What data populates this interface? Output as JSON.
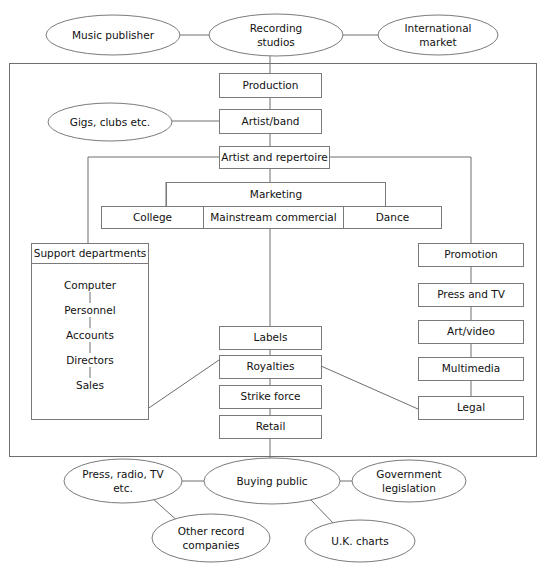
{
  "diagram": {
    "type": "org-flow-diagram",
    "style": {
      "background": "#ffffff",
      "stroke": "#6e6e6e",
      "node_fill": "#ffffff",
      "text_color": "#111111"
    },
    "external_top": [
      {
        "id": "music-publisher",
        "label": "Music publisher",
        "shape": "ellipse",
        "cx": 113,
        "cy": 35,
        "rx": 67,
        "ry": 20
      },
      {
        "id": "recording-studios",
        "label": "Recording\nstudios",
        "line1": "Recording",
        "line2": "studios",
        "shape": "ellipse",
        "cx": 276,
        "cy": 35,
        "rx": 67,
        "ry": 21
      },
      {
        "id": "international-market",
        "label": "International\nmarket",
        "line1": "International",
        "line2": "market",
        "shape": "ellipse",
        "cx": 438,
        "cy": 35,
        "rx": 60,
        "ry": 20
      }
    ],
    "external_left": [
      {
        "id": "gigs-clubs",
        "label": "Gigs, clubs etc.",
        "shape": "ellipse",
        "cx": 110,
        "cy": 122,
        "rx": 62,
        "ry": 19
      }
    ],
    "external_bottom": [
      {
        "id": "press-radio-tv",
        "label": "Press, radio, TV\netc.",
        "line1": "Press, radio, TV",
        "line2": "etc.",
        "shape": "ellipse",
        "cx": 123,
        "cy": 481,
        "rx": 59,
        "ry": 22
      },
      {
        "id": "buying-public",
        "label": "Buying public",
        "shape": "ellipse",
        "cx": 272,
        "cy": 481,
        "rx": 68,
        "ry": 23
      },
      {
        "id": "government-legislation",
        "label": "Government\nlegislation",
        "line1": "Government",
        "line2": "legislation",
        "shape": "ellipse",
        "cx": 409,
        "cy": 481,
        "rx": 57,
        "ry": 21
      },
      {
        "id": "other-record-companies",
        "label": "Other record\ncompanies",
        "line1": "Other record",
        "line2": "companies",
        "shape": "ellipse",
        "cx": 211,
        "cy": 538,
        "rx": 59,
        "ry": 24
      },
      {
        "id": "uk-charts",
        "label": "U.K. charts",
        "shape": "ellipse",
        "cx": 360,
        "cy": 541,
        "rx": 55,
        "ry": 21
      }
    ],
    "main_chain": [
      {
        "id": "production",
        "label": "Production",
        "x": 219,
        "y": 73,
        "w": 102,
        "h": 24
      },
      {
        "id": "artist-band",
        "label": "Artist/band",
        "x": 219,
        "y": 109,
        "w": 102,
        "h": 24
      },
      {
        "id": "artist-and-repertoire",
        "label": "Artist and repertoire",
        "x": 219,
        "y": 146,
        "w": 110,
        "h": 22
      }
    ],
    "marketing": {
      "id": "marketing",
      "label": "Marketing",
      "x": 166,
      "y": 182,
      "w": 219,
      "h": 24,
      "children": [
        {
          "id": "college",
          "label": "College",
          "x": 101,
          "y": 206,
          "w": 102,
          "h": 22
        },
        {
          "id": "mainstream-commercial",
          "label": "Mainstream commercial",
          "x": 203,
          "y": 206,
          "w": 140,
          "h": 22
        },
        {
          "id": "dance",
          "label": "Dance",
          "x": 343,
          "y": 206,
          "w": 98,
          "h": 22
        }
      ]
    },
    "support": {
      "id": "support-departments",
      "header_label": "Support departments",
      "header": {
        "x": 31,
        "y": 243,
        "w": 117,
        "h": 20
      },
      "body": {
        "x": 31,
        "y": 263,
        "w": 117,
        "h": 156
      },
      "items": [
        {
          "id": "computer",
          "label": "Computer"
        },
        {
          "id": "personnel",
          "label": "Personnel"
        },
        {
          "id": "accounts",
          "label": "Accounts"
        },
        {
          "id": "directors",
          "label": "Directors"
        },
        {
          "id": "sales",
          "label": "Sales"
        }
      ]
    },
    "center_column": [
      {
        "id": "labels",
        "label": "Labels",
        "x": 219,
        "y": 326,
        "w": 102,
        "h": 23
      },
      {
        "id": "royalties",
        "label": "Royalties",
        "x": 219,
        "y": 355,
        "w": 102,
        "h": 23
      },
      {
        "id": "strike-force",
        "label": "Strike force",
        "x": 219,
        "y": 385,
        "w": 102,
        "h": 23
      },
      {
        "id": "retail",
        "label": "Retail",
        "x": 219,
        "y": 415,
        "w": 102,
        "h": 23
      }
    ],
    "right_column": [
      {
        "id": "promotion",
        "label": "Promotion",
        "x": 418,
        "y": 243,
        "w": 105,
        "h": 23
      },
      {
        "id": "press-and-tv",
        "label": "Press and TV",
        "x": 418,
        "y": 283,
        "w": 105,
        "h": 23
      },
      {
        "id": "art-video",
        "label": "Art/video",
        "x": 418,
        "y": 320,
        "w": 105,
        "h": 23
      },
      {
        "id": "multimedia",
        "label": "Multimedia",
        "x": 418,
        "y": 357,
        "w": 105,
        "h": 23
      },
      {
        "id": "legal",
        "label": "Legal",
        "x": 418,
        "y": 396,
        "w": 105,
        "h": 23
      }
    ],
    "outer_box": {
      "x": 9,
      "y": 63,
      "w": 527,
      "h": 393
    }
  }
}
